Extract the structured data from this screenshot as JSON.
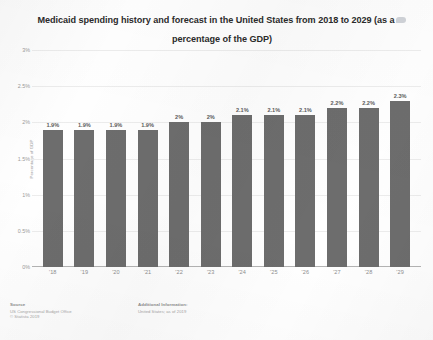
{
  "chart_data": {
    "type": "bar",
    "title": "Medicaid spending history and forecast in the United States from 2018 to 2029 (as a percentage of the GDP)",
    "title_line1": "Medicaid spending history and forecast in the United States from 2018 to 2029 (as a",
    "title_line2": "percentage of the GDP)",
    "xlabel": "",
    "ylabel": "Percentage of GDP",
    "categories": [
      "'18",
      "'19",
      "'20",
      "'21",
      "'22",
      "'23",
      "'24",
      "'25",
      "'26",
      "'27",
      "'28",
      "'29"
    ],
    "values": [
      1.9,
      1.9,
      1.9,
      1.9,
      2.0,
      2.0,
      2.1,
      2.1,
      2.1,
      2.2,
      2.2,
      2.3
    ],
    "value_labels": [
      "1.9%",
      "1.9%",
      "1.9%",
      "1.9%",
      "2%",
      "2%",
      "2.1%",
      "2.1%",
      "2.1%",
      "2.2%",
      "2.2%",
      "2.3%"
    ],
    "ylim": [
      0,
      3
    ],
    "y_ticks": [
      0,
      0.5,
      1,
      1.5,
      2,
      2.5,
      3
    ],
    "y_tick_labels": [
      "0%",
      "0.5%",
      "1%",
      "1.5%",
      "2%",
      "2.5%",
      "3%"
    ],
    "grid": true,
    "legend": "none",
    "bar_color": "#6d6d6d",
    "value_label_color": "#5d5d5d",
    "grid_color": "#ededed",
    "axis_color": "#b4b4b4"
  },
  "footer": {
    "source_heading": "Source",
    "source_lines": [
      "US Congressional Budget Office",
      "© Statista 2019"
    ],
    "additional_heading": "Additional Information:",
    "additional_lines": [
      "United States; as of 2019"
    ]
  },
  "icons": {
    "title_badge": "statista-logo-icon"
  }
}
